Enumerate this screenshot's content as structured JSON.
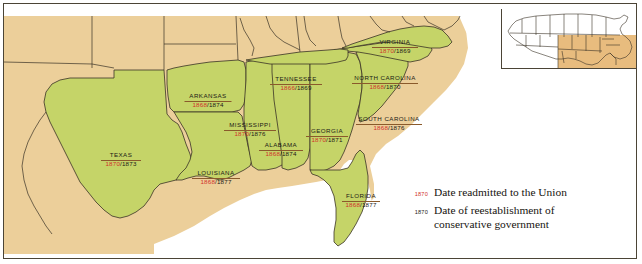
{
  "map": {
    "title_visible": false,
    "colors": {
      "confederate_fill": "#c5d468",
      "other_states_fill": "#eccf9a",
      "ocean_fill": "#ffffff",
      "border_line": "#4b4436",
      "state_line": "#3a3226",
      "readmitted_date": "#d1322a",
      "conservative_date": "#1c1a16",
      "inset_highlight": "#e8bc7e",
      "label_rule": "#8a5a2b"
    },
    "states": [
      {
        "name": "VIRGINIA",
        "readmitted": "1870",
        "conservative": "1869",
        "x": 391,
        "y": 35,
        "width": 46
      },
      {
        "name": "TENNESSEE",
        "readmitted": "1866",
        "conservative": "1869",
        "x": 292,
        "y": 72,
        "width": 52
      },
      {
        "name": "NORTH CAROLINA",
        "readmitted": "1868",
        "conservative": "1870",
        "x": 381,
        "y": 71,
        "width": 66
      },
      {
        "name": "ARKANSAS",
        "readmitted": "1868",
        "conservative": "1874",
        "x": 204,
        "y": 89,
        "width": 47
      },
      {
        "name": "SOUTH CAROLINA",
        "readmitted": "1868",
        "conservative": "1876",
        "x": 385,
        "y": 112,
        "width": 66
      },
      {
        "name": "MISSISSIPPI",
        "readmitted": "1870",
        "conservative": "1876",
        "x": 246,
        "y": 118,
        "width": 52
      },
      {
        "name": "GEORGIA",
        "readmitted": "1870",
        "conservative": "1871",
        "x": 323,
        "y": 124,
        "width": 42
      },
      {
        "name": "ALABAMA",
        "readmitted": "1868",
        "conservative": "1874",
        "x": 277,
        "y": 138,
        "width": 44
      },
      {
        "name": "TEXAS",
        "readmitted": "1870",
        "conservative": "1873",
        "x": 117,
        "y": 148,
        "width": 40
      },
      {
        "name": "LOUISIANA",
        "readmitted": "1868",
        "conservative": "1877",
        "x": 212,
        "y": 166,
        "width": 48
      },
      {
        "name": "FLORIDA",
        "readmitted": "1868",
        "conservative": "1877",
        "x": 357,
        "y": 189,
        "width": 38
      }
    ],
    "date_separator": "/"
  },
  "legend": {
    "rows": [
      {
        "key": "1870",
        "key_color": "red",
        "text": "Date readmitted to the Union"
      },
      {
        "key": "1870",
        "key_color": "black",
        "text": "Date of reestablishment of\nconservative government"
      }
    ]
  },
  "inset": {
    "name": "united-states-locator-map",
    "highlight_region": "southeastern-united-states"
  }
}
